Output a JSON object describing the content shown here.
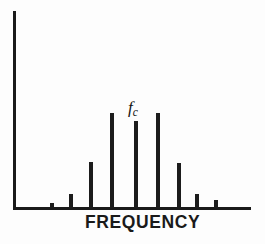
{
  "figure": {
    "background_color": "#fdfdfd",
    "ink_color": "#1a1a1a",
    "width": 265,
    "height": 244
  },
  "annotations": {
    "carrier_symbol": "f",
    "carrier_subscript": "c"
  },
  "chart_data": {
    "type": "bar",
    "title": "",
    "subtitle": "",
    "xlabel": "FREQUENCY",
    "ylabel": "",
    "grid": false,
    "legend": null,
    "xlim": [
      0,
      10
    ],
    "ylim": [
      0,
      100
    ],
    "axis": {
      "y_axis_x_px": 14,
      "baseline_y_px": 208,
      "y_axis_top_px": 11,
      "x_axis_right_px": 251
    },
    "categories": [
      "carrier-axis",
      "sb-4L",
      "sb-3L",
      "sb-2L",
      "sb-1L",
      "fc",
      "sb-1U",
      "sb-2U",
      "sb-3U",
      "sb-4U"
    ],
    "values": [
      100,
      2.5,
      7,
      23,
      48,
      44,
      23,
      7,
      4,
      2.5
    ],
    "points": [
      {
        "label": "axis",
        "x_px": 14,
        "top_px": 11,
        "height_px": 197,
        "width_px": 2.6,
        "is_axis": true
      },
      {
        "label": "sb-4L",
        "x_px": 52,
        "top_px": 203,
        "height_px": 5,
        "width_px": 3.2,
        "is_axis": false
      },
      {
        "label": "sb-3L",
        "x_px": 71,
        "top_px": 194,
        "height_px": 14,
        "width_px": 3.4,
        "is_axis": false
      },
      {
        "label": "sb-2L",
        "x_px": 91,
        "top_px": 162,
        "height_px": 46,
        "width_px": 3.6,
        "is_axis": false
      },
      {
        "label": "sb-1L",
        "x_px": 112,
        "top_px": 113,
        "height_px": 95,
        "width_px": 3.6,
        "is_axis": false
      },
      {
        "label": "fc",
        "x_px": 136,
        "top_px": 121,
        "height_px": 87,
        "width_px": 3.6,
        "is_axis": false
      },
      {
        "label": "sb-1U",
        "x_px": 158,
        "top_px": 113,
        "height_px": 95,
        "width_px": 3.6,
        "is_axis": false
      },
      {
        "label": "sb-2U",
        "x_px": 179,
        "top_px": 163,
        "height_px": 45,
        "width_px": 3.6,
        "is_axis": false
      },
      {
        "label": "sb-3U",
        "x_px": 197,
        "top_px": 194,
        "height_px": 14,
        "width_px": 3.4,
        "is_axis": false
      },
      {
        "label": "sb-4U",
        "x_px": 216,
        "top_px": 200,
        "height_px": 8,
        "width_px": 3.2,
        "is_axis": false
      }
    ],
    "annotation_positions": {
      "fc_label_left_px": 128,
      "fc_label_top_px": 99,
      "xlabel_left_px": 85,
      "xlabel_top_px": 214
    }
  }
}
